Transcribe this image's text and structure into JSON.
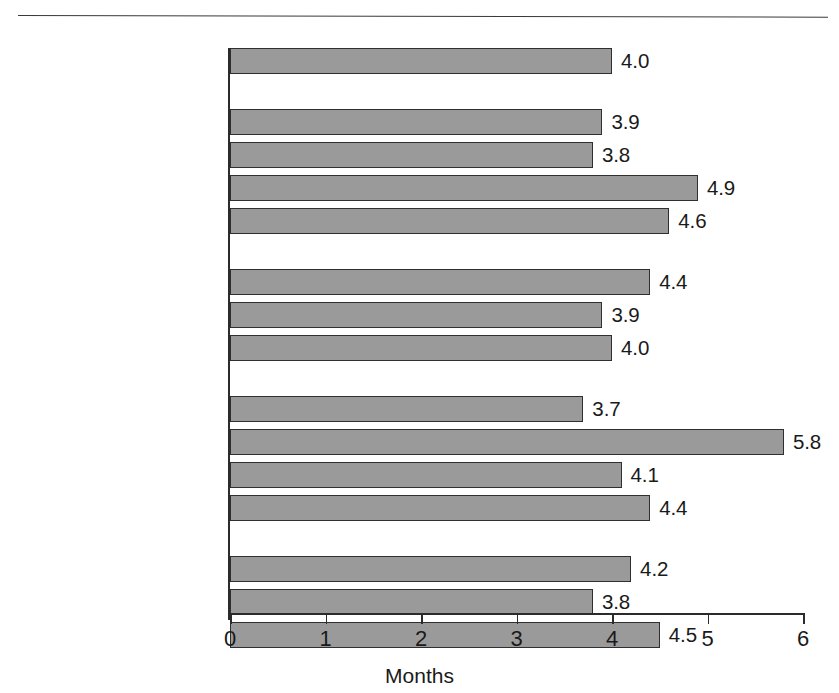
{
  "chart_data": {
    "type": "bar",
    "orientation": "horizontal",
    "title": "",
    "subtitle": "",
    "xlabel": "Months",
    "ylabel": "",
    "xlim": [
      0,
      6
    ],
    "xticks": [
      "0",
      "1",
      "2",
      "3",
      "4",
      "5",
      "6"
    ],
    "grid": false,
    "legend": false,
    "bar_color": "#9a9a9a",
    "bar_edge_color": "#2f2f2f",
    "categories": [
      "All",
      "White",
      "White, not Hispanic",
      "Black",
      "Hispanic",
      "0 to 17 years",
      "18 to 64 years",
      "65 years and over",
      "Married-couple family",
      "Female householder",
      "Male householder",
      "Unrelated individual",
      "Central city",
      "Suburbs",
      "Nonmetropolitan"
    ],
    "values": [
      4.0,
      3.9,
      3.8,
      4.9,
      4.6,
      4.4,
      3.9,
      4.0,
      3.7,
      5.8,
      4.1,
      4.4,
      4.2,
      3.8,
      4.5
    ],
    "value_labels": [
      "4.0",
      "3.9",
      "3.8",
      "4.9",
      "4.6",
      "4.4",
      "3.9",
      "4.0",
      "3.7",
      "5.8",
      "4.1",
      "4.4",
      "4.2",
      "3.8",
      "4.5"
    ],
    "groups": [
      {
        "name": "overall",
        "categories": [
          "All"
        ]
      },
      {
        "name": "race-ethnicity",
        "categories": [
          "White",
          "White, not Hispanic",
          "Black",
          "Hispanic"
        ]
      },
      {
        "name": "age",
        "categories": [
          "0 to 17 years",
          "18 to 64 years",
          "65 years and over"
        ]
      },
      {
        "name": "household-type",
        "categories": [
          "Married-couple family",
          "Female householder",
          "Male householder",
          "Unrelated individual"
        ]
      },
      {
        "name": "residence",
        "categories": [
          "Central city",
          "Suburbs",
          "Nonmetropolitan"
        ]
      }
    ]
  }
}
